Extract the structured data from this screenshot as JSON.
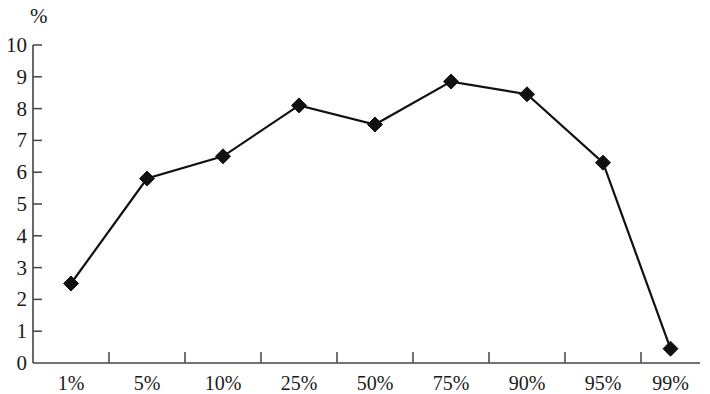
{
  "chart_data": {
    "type": "line",
    "title": "",
    "subtitle": "",
    "xlabel": "",
    "ylabel": "%",
    "categories": [
      "1%",
      "5%",
      "10%",
      "25%",
      "50%",
      "75%",
      "90%",
      "95%",
      "99%"
    ],
    "values": [
      2.5,
      5.8,
      6.5,
      8.1,
      7.5,
      8.85,
      8.45,
      6.3,
      0.45
    ],
    "series": [
      {
        "name": "",
        "values": [
          2.5,
          5.8,
          6.5,
          8.1,
          7.5,
          8.85,
          8.45,
          6.3,
          0.45
        ]
      }
    ],
    "ylim": [
      0,
      10
    ],
    "yticks": [
      0,
      1,
      2,
      3,
      4,
      5,
      6,
      7,
      8,
      9,
      10
    ],
    "ytick_labels": [
      "0",
      "1",
      "2",
      "3",
      "4",
      "5",
      "6",
      "7",
      "8",
      "9",
      "10"
    ],
    "xtick_labels": [
      "1%",
      "5%",
      "10%",
      "25%",
      "50%",
      "75%",
      "90%",
      "95%",
      "99%"
    ],
    "grid": false,
    "legend": false,
    "legend_position": "none",
    "marker": "diamond",
    "line_color": "#111111",
    "marker_color": "#111111",
    "axis_color": "#444444",
    "background_color": "#ffffff"
  }
}
